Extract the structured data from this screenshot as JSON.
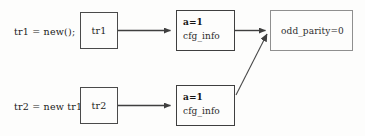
{
  "diagram": {
    "type": "object-reference-diagram",
    "background_color": "#fdfdfc",
    "rows": [
      {
        "statement": "tr1 = new();",
        "handle": {
          "label": "tr1"
        },
        "object": {
          "field_primary": "a=1",
          "field_secondary": "cfg_info"
        }
      },
      {
        "statement": "tr2 = new tr1;",
        "handle": {
          "label": "tr2"
        },
        "object": {
          "field_primary": "a=1",
          "field_secondary": "cfg_info"
        }
      }
    ],
    "shared_object": {
      "label": "odd_parity=0",
      "border_color": "#8f8f8f"
    },
    "stroke_color": "#3f3f3f",
    "arrows": [
      {
        "from": "handle-tr1",
        "to": "object-tr1",
        "style": "solid-straight"
      },
      {
        "from": "object-tr1",
        "to": "shared-config-object",
        "style": "solid-straight"
      },
      {
        "from": "handle-tr2",
        "to": "object-tr2",
        "style": "solid-straight"
      },
      {
        "from": "object-tr2",
        "to": "shared-config-object",
        "style": "solid-diagonal"
      }
    ]
  }
}
